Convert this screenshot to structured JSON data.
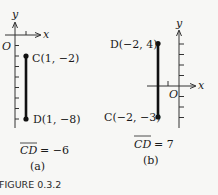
{
  "figure": {
    "caption": "FIGURE 0.3.2",
    "panels": [
      {
        "id": "a",
        "label": "(a)",
        "x_axis_label": "x",
        "y_axis_label": "y",
        "origin_label": "O",
        "points": [
          {
            "name": "C",
            "x": 1,
            "y": -2,
            "label": "C(1, −2)"
          },
          {
            "name": "D",
            "x": 1,
            "y": -8,
            "label": "D(1, −8)"
          }
        ],
        "directed_distance": {
          "lhs": "CD",
          "rhs": "= −6",
          "value": -6
        }
      },
      {
        "id": "b",
        "label": "(b)",
        "x_axis_label": "x",
        "y_axis_label": "y",
        "origin_label": "O",
        "points": [
          {
            "name": "D",
            "x": -2,
            "y": 4,
            "label": "D(−2, 4)"
          },
          {
            "name": "C",
            "x": -2,
            "y": -3,
            "label": "C(−2, −3)"
          }
        ],
        "directed_distance": {
          "lhs": "CD",
          "rhs": "= 7",
          "value": 7
        }
      }
    ]
  },
  "colors": {
    "ink": "#1a1a1a",
    "background": "#f7f7f5"
  }
}
